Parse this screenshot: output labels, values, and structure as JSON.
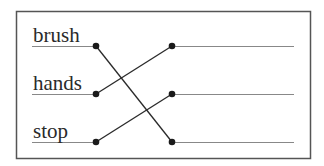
{
  "diagram": {
    "type": "matching-exercise",
    "left_items": [
      {
        "label": "brush"
      },
      {
        "label": "hands"
      },
      {
        "label": "stop"
      }
    ],
    "right_items": [
      {
        "label": ""
      },
      {
        "label": ""
      },
      {
        "label": ""
      }
    ],
    "connections": [
      {
        "from": "brush",
        "to_index": 2
      },
      {
        "from": "hands",
        "to_index": 0
      },
      {
        "from": "stop",
        "to_index": 1
      }
    ],
    "colors": {
      "border": "#555555",
      "line": "#888888",
      "connector": "#2a2a2a",
      "text": "#2a2a2a"
    }
  }
}
